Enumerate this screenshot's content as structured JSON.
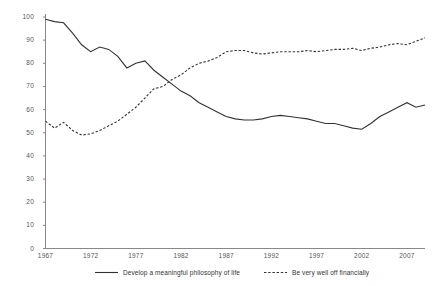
{
  "chart_data": {
    "type": "line",
    "title": "",
    "subtitle": "",
    "xlabel": "",
    "ylabel": "",
    "xlim": [
      1967,
      2009
    ],
    "ylim": [
      0,
      100
    ],
    "grid": false,
    "legend_position": "bottom",
    "y_ticks": [
      0,
      10,
      20,
      30,
      40,
      50,
      60,
      70,
      80,
      90,
      100
    ],
    "y_tick_labels": [
      "0",
      "10",
      "20",
      "30",
      "40",
      "50",
      "60",
      "70",
      "80",
      "90",
      "100"
    ],
    "x_ticks": [
      1967,
      1972,
      1977,
      1982,
      1987,
      1992,
      1997,
      2002,
      2007
    ],
    "x_tick_labels": [
      "1967",
      "1972",
      "1977",
      "1982",
      "1987",
      "1992",
      "1997",
      "2002",
      "2007"
    ],
    "x": [
      1967,
      1968,
      1969,
      1970,
      1971,
      1972,
      1973,
      1974,
      1975,
      1976,
      1977,
      1978,
      1979,
      1980,
      1981,
      1982,
      1983,
      1984,
      1985,
      1986,
      1987,
      1988,
      1989,
      1990,
      1991,
      1992,
      1993,
      1994,
      1995,
      1996,
      1997,
      1998,
      1999,
      2000,
      2001,
      2002,
      2003,
      2004,
      2005,
      2006,
      2007,
      2008,
      2009
    ],
    "series": [
      {
        "name": "Develop a meaningful philosophy of life",
        "style": "solid",
        "color": "#333333",
        "values": [
          99,
          98,
          97.5,
          93,
          88,
          85,
          87,
          86,
          83,
          78,
          80,
          81,
          77,
          74,
          71,
          68,
          66,
          63,
          61,
          59,
          57,
          56,
          55.5,
          55.5,
          56,
          57,
          57.5,
          57,
          56.5,
          56,
          55,
          54,
          54,
          53,
          52,
          51.5,
          54,
          57,
          59,
          61,
          63,
          61,
          62
        ]
      },
      {
        "name": "Be very well off financially",
        "style": "dashed",
        "color": "#333333",
        "values": [
          55,
          52,
          54.5,
          51,
          49,
          49.5,
          51,
          53,
          55,
          58,
          61,
          65,
          69,
          70,
          73,
          75,
          78,
          80,
          81,
          82.5,
          85,
          85.5,
          85.5,
          84.5,
          84,
          84.5,
          85,
          85,
          85,
          85.5,
          85,
          85.5,
          86,
          86,
          86.5,
          85.5,
          86.5,
          87,
          88,
          88.5,
          88,
          89.5,
          91
        ]
      }
    ],
    "legend": [
      {
        "label": "Develop a meaningful philosophy of life",
        "style": "solid"
      },
      {
        "label": "Be very well off financially",
        "style": "dashed"
      }
    ]
  },
  "axis": {
    "line_color": "#888888"
  }
}
